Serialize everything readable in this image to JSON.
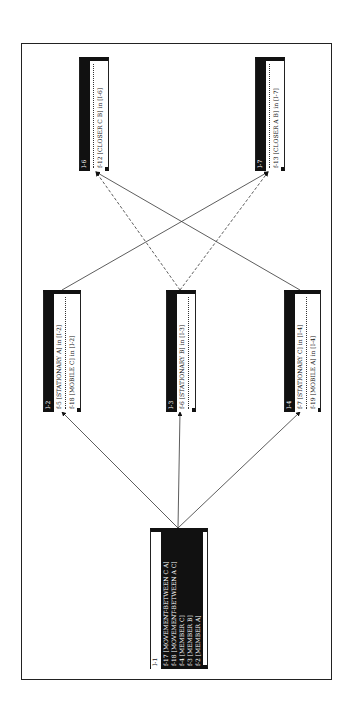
{
  "diagram": {
    "nodes": [
      {
        "id": "I-1",
        "label": "I-1",
        "facts": [
          {
            "id": "f-17",
            "text": "f-17 [MOVEMENT-BETWEEN C A]"
          },
          {
            "id": "f-18",
            "text": "f-18 [MOVEMENT-BETWEEN A C]"
          },
          {
            "id": "f-4",
            "text": "f-4 [MEMBER C]"
          },
          {
            "id": "f-3",
            "text": "f-3 [MEMBER B]"
          },
          {
            "id": "f-2",
            "text": "f-2 [MEMBER A]"
          }
        ]
      },
      {
        "id": "I-2",
        "label": "I-2",
        "facts": [
          {
            "id": "f-5",
            "text": "f-5 [STATIONARY A] in [I-2]"
          },
          {
            "id": "f-18",
            "text": "f-18 [MOBILE C] in [I-2]"
          }
        ]
      },
      {
        "id": "I-3",
        "label": "I-3",
        "facts": [
          {
            "id": "f-6",
            "text": "f-6 [STATIONARY B] in [I-3]"
          }
        ]
      },
      {
        "id": "I-4",
        "label": "I-4",
        "facts": [
          {
            "id": "f-7",
            "text": "f-7 [STATIONARY C] in [I-4]"
          },
          {
            "id": "f-19",
            "text": "f-19 [MOBILE A] in [I-4]"
          }
        ]
      },
      {
        "id": "I-6",
        "label": "I-6",
        "facts": [
          {
            "id": "f-12",
            "text": "f-12 [CLOSER C B] in [I-6]"
          }
        ]
      },
      {
        "id": "I-7",
        "label": "I-7",
        "facts": [
          {
            "id": "f-13",
            "text": "f-13 [CLOSER A B] in [I-7]"
          }
        ]
      }
    ],
    "edges": [
      {
        "from": "I-1",
        "to": "I-2",
        "style": "solid"
      },
      {
        "from": "I-1",
        "to": "I-3",
        "style": "solid"
      },
      {
        "from": "I-1",
        "to": "I-4",
        "style": "solid"
      },
      {
        "from": "I-2",
        "to": "I-7",
        "style": "solid"
      },
      {
        "from": "I-3",
        "to": "I-6",
        "style": "dashed"
      },
      {
        "from": "I-3",
        "to": "I-7",
        "style": "dashed"
      },
      {
        "from": "I-4",
        "to": "I-6",
        "style": "solid"
      }
    ],
    "colors": {
      "ink": "#111111",
      "background": "#ffffff"
    }
  }
}
